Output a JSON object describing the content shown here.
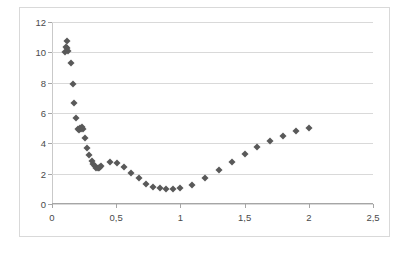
{
  "chart_data": {
    "type": "scatter",
    "title": "",
    "xlabel": "",
    "ylabel": "",
    "xlim": [
      0,
      2.5
    ],
    "ylim": [
      0,
      12
    ],
    "grid": true,
    "legend": false,
    "decimal_separator": ",",
    "marker": "diamond",
    "marker_color": "#595959",
    "xticks": [
      0,
      0.5,
      1,
      1.5,
      2,
      2.5
    ],
    "xtick_labels": [
      "0",
      "0,5",
      "1",
      "1,5",
      "2",
      "2,5"
    ],
    "yticks": [
      0,
      2,
      4,
      6,
      8,
      10,
      12
    ],
    "ytick_labels": [
      "0",
      "2",
      "4",
      "6",
      "8",
      "10",
      "12"
    ],
    "series": [
      {
        "name": "series-1",
        "points": [
          [
            0.105,
            10.05
          ],
          [
            0.11,
            10.35
          ],
          [
            0.115,
            10.75
          ],
          [
            0.12,
            10.3
          ],
          [
            0.125,
            10.1
          ],
          [
            0.145,
            9.27
          ],
          [
            0.16,
            7.93
          ],
          [
            0.175,
            6.65
          ],
          [
            0.19,
            5.68
          ],
          [
            0.2,
            4.93
          ],
          [
            0.21,
            4.88
          ],
          [
            0.215,
            5.0
          ],
          [
            0.222,
            4.95
          ],
          [
            0.23,
            5.05
          ],
          [
            0.238,
            4.92
          ],
          [
            0.255,
            4.32
          ],
          [
            0.275,
            3.72
          ],
          [
            0.292,
            3.22
          ],
          [
            0.308,
            2.85
          ],
          [
            0.32,
            2.62
          ],
          [
            0.332,
            2.48
          ],
          [
            0.345,
            2.4
          ],
          [
            0.355,
            2.38
          ],
          [
            0.365,
            2.4
          ],
          [
            0.375,
            2.45
          ],
          [
            0.385,
            2.5
          ],
          [
            0.45,
            2.77
          ],
          [
            0.51,
            2.72
          ],
          [
            0.56,
            2.42
          ],
          [
            0.615,
            2.07
          ],
          [
            0.675,
            1.72
          ],
          [
            0.735,
            1.35
          ],
          [
            0.79,
            1.15
          ],
          [
            0.84,
            1.03
          ],
          [
            0.89,
            1.0
          ],
          [
            0.945,
            1.0
          ],
          [
            1.0,
            1.05
          ],
          [
            1.09,
            1.28
          ],
          [
            1.195,
            1.7
          ],
          [
            1.3,
            2.22
          ],
          [
            1.4,
            2.77
          ],
          [
            1.5,
            3.3
          ],
          [
            1.6,
            3.77
          ],
          [
            1.7,
            4.15
          ],
          [
            1.8,
            4.48
          ],
          [
            1.9,
            4.8
          ],
          [
            2.0,
            5.03
          ]
        ]
      }
    ]
  }
}
